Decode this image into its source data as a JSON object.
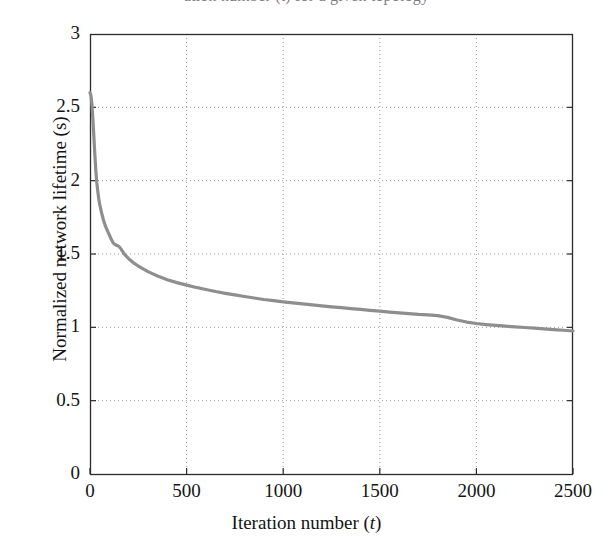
{
  "figure": {
    "top_cropped_caption": "ation number (t) for a given topology",
    "background_color": "#ffffff",
    "plot_box": {
      "left_px": 90,
      "top_px": 34,
      "right_px": 573,
      "bottom_px": 474,
      "border_color": "#2b2b2b"
    }
  },
  "chart_data": {
    "type": "line",
    "title": "",
    "subtitle": "",
    "xlabel": "Iteration number (t)",
    "xlabel_parts": {
      "text": "Iteration number (",
      "variable": "t",
      "tail": ")"
    },
    "ylabel": "Normalized network lifetime (s)",
    "xlim": [
      0,
      2500
    ],
    "ylim": [
      0,
      3
    ],
    "xticks": [
      0,
      500,
      1000,
      1500,
      2000,
      2500
    ],
    "xtick_labels": [
      "0",
      "500",
      "1000",
      "1500",
      "2000",
      "2500"
    ],
    "yticks": [
      0,
      0.5,
      1,
      1.5,
      2,
      2.5,
      3
    ],
    "ytick_labels": [
      "0",
      "0.5",
      "1",
      "1.5",
      "2",
      "2.5",
      "3"
    ],
    "grid": true,
    "grid_style": "dotted",
    "grid_color": "#9a9a9a",
    "legend": null,
    "legend_position": "none",
    "series": [
      {
        "name": "Normalized network lifetime",
        "color": "#8e8e8e",
        "line_width": 3.2,
        "x": [
          0,
          5,
          10,
          15,
          20,
          25,
          30,
          35,
          40,
          45,
          50,
          60,
          70,
          80,
          90,
          100,
          110,
          120,
          130,
          140,
          150,
          160,
          170,
          180,
          200,
          225,
          250,
          275,
          300,
          350,
          400,
          450,
          500,
          550,
          600,
          650,
          700,
          750,
          800,
          850,
          900,
          950,
          1000,
          1050,
          1100,
          1150,
          1200,
          1250,
          1300,
          1350,
          1400,
          1450,
          1500,
          1550,
          1600,
          1650,
          1700,
          1750,
          1800,
          1850,
          1900,
          1950,
          2000,
          2050,
          2100,
          2150,
          2200,
          2250,
          2300,
          2350,
          2400,
          2450,
          2500
        ],
        "y": [
          2.6,
          2.58,
          2.52,
          2.42,
          2.3,
          2.18,
          2.07,
          1.99,
          1.93,
          1.88,
          1.84,
          1.78,
          1.73,
          1.69,
          1.66,
          1.63,
          1.6,
          1.575,
          1.565,
          1.558,
          1.552,
          1.535,
          1.515,
          1.495,
          1.468,
          1.44,
          1.418,
          1.398,
          1.38,
          1.35,
          1.325,
          1.305,
          1.288,
          1.272,
          1.258,
          1.244,
          1.232,
          1.221,
          1.21,
          1.2,
          1.19,
          1.182,
          1.174,
          1.167,
          1.16,
          1.153,
          1.146,
          1.14,
          1.134,
          1.128,
          1.122,
          1.116,
          1.11,
          1.104,
          1.098,
          1.093,
          1.088,
          1.085,
          1.08,
          1.068,
          1.05,
          1.036,
          1.026,
          1.019,
          1.013,
          1.008,
          1.003,
          0.999,
          0.994,
          0.989,
          0.984,
          0.98,
          0.975
        ]
      }
    ],
    "annotations": []
  }
}
